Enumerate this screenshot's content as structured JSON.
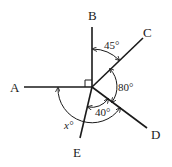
{
  "diagram": {
    "points": {
      "A": "A",
      "B": "B",
      "C": "C",
      "D": "D",
      "E": "E"
    },
    "angles": {
      "BOC": "45°",
      "COD": "80°",
      "DOE": "40°",
      "AOD": "x°"
    },
    "right_angle": "AOB",
    "colors": {
      "line": "#1a1a1a",
      "background": "#ffffff"
    }
  }
}
